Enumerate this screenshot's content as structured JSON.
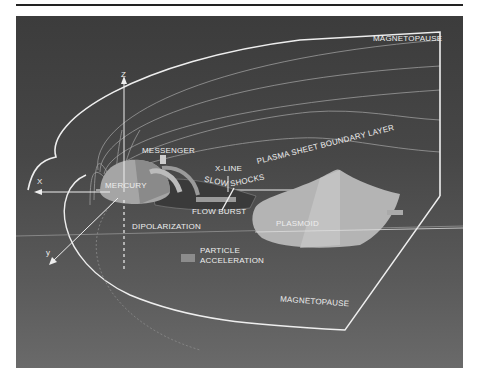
{
  "figure": {
    "labels": {
      "magnetopause_top": "MAGNETOPAUSE",
      "magnetopause_bottom": "MAGNETOPAUSE",
      "z_axis": "Z",
      "x_axis": "X",
      "y_axis": "y",
      "messenger": "MESSENGER",
      "mercury": "MERCURY",
      "x_line": "X-LINE",
      "slow": "SLOW",
      "shocks": "SHOCKS",
      "plasma_sheet_boundary_layer": "PLASMA SHEET BOUNDARY LAYER",
      "flow_burst": "FLOW BURST",
      "plasmoid": "PLASMOID",
      "dipolarization": "DIPOLARIZATION",
      "particle_acceleration_1": "PARTICLE",
      "particle_acceleration_2": "ACCELERATION"
    },
    "colors": {
      "background_top": "#3c3c3c",
      "background_bottom": "#6a6a6a",
      "lines": "#e8e8e8",
      "plasmoid": "#b0b0b0",
      "planet": "#a0a0a0"
    }
  }
}
